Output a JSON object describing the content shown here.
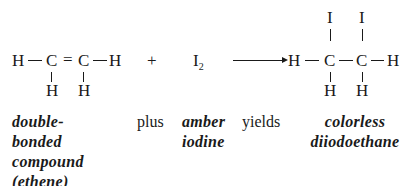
{
  "reactant": {
    "atoms": {
      "h_left": "H",
      "c1": "C",
      "double_bond": "=",
      "c2": "C",
      "h_right": "H",
      "h_below_c1": "H",
      "h_below_c2": "H"
    },
    "label_lines": [
      "double-",
      "bonded",
      "compound",
      "(ethene)"
    ]
  },
  "plus_symbol": "+",
  "reagent": {
    "symbol": "I",
    "subscript": "2",
    "label_lines": [
      "amber",
      "iodine"
    ]
  },
  "product": {
    "atoms": {
      "h_left": "H",
      "c1": "C",
      "c2": "C",
      "h_right": "H",
      "i_above_c1": "I",
      "i_above_c2": "I",
      "h_below_c1": "H",
      "h_below_c2": "H"
    },
    "label_lines": [
      "colorless",
      "diiodoethane"
    ]
  },
  "words": {
    "plus": "plus",
    "yields": "yields"
  }
}
